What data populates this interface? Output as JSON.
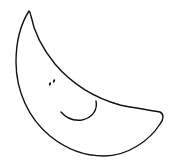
{
  "illustration": {
    "subject": "smiling crescent moon",
    "style": "hand-drawn line art",
    "colors": {
      "background": "#ffffff",
      "stroke": "#111111"
    },
    "features": {
      "eyes": 2,
      "mouth": "smile"
    }
  }
}
